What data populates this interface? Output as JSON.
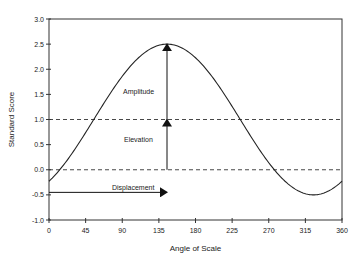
{
  "chart_data": {
    "type": "line",
    "title": "",
    "xlabel": "Angle of Scale",
    "ylabel": "Standard Score",
    "xlim": [
      0,
      360
    ],
    "ylim": [
      -1.0,
      3.0
    ],
    "xticks": [
      0,
      45,
      90,
      135,
      180,
      225,
      270,
      315,
      360
    ],
    "yticks": [
      -1.0,
      -0.5,
      0.0,
      0.5,
      1.0,
      1.5,
      2.0,
      2.5,
      3.0
    ],
    "ytick_labels": [
      "-1.0",
      "-0.5",
      "0.0",
      "0.5",
      "1.0",
      "1.5",
      "2.0",
      "2.5",
      "3.0"
    ],
    "grid": false,
    "legend": null,
    "series": [
      {
        "name": "Cosine curve",
        "function": "y = 1.0 + 1.5 * cos(x - 145)",
        "x": [
          0,
          45,
          90,
          135,
          145,
          180,
          225,
          270,
          315,
          325,
          360
        ],
        "values": [
          -0.23,
          0.74,
          1.86,
          2.48,
          2.5,
          2.23,
          1.26,
          0.14,
          -0.48,
          -0.5,
          -0.23
        ]
      }
    ],
    "reference_lines": [
      {
        "type": "horizontal",
        "y": 1.0,
        "style": "dashed"
      },
      {
        "type": "horizontal",
        "y": 0.0,
        "style": "dashed"
      }
    ],
    "annotations": [
      {
        "label": "Amplitude",
        "type": "vertical-arrow",
        "x": 145,
        "from": 1.0,
        "to": 2.5
      },
      {
        "label": "Elevation",
        "type": "vertical-arrow",
        "x": 145,
        "from": 0.0,
        "to": 1.0
      },
      {
        "label": "Displacement",
        "type": "horizontal-arrow",
        "y": -0.45,
        "from": 0,
        "to": 145
      }
    ]
  },
  "labels": {
    "xlabel": "Angle of Scale",
    "ylabel": "Standard Score",
    "amplitude": "Amplitude",
    "elevation": "Elevation",
    "displacement": "Displacement"
  }
}
